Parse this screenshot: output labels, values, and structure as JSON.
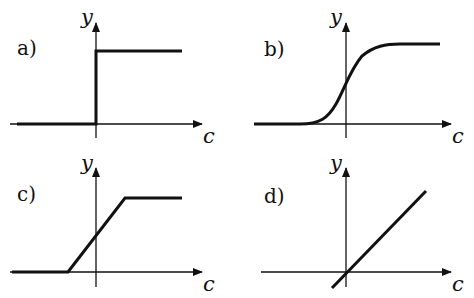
{
  "figure": {
    "panels": [
      {
        "id": "a",
        "label": "a)",
        "x_axis_label": "c",
        "y_axis_label": "y",
        "curve": "step function"
      },
      {
        "id": "b",
        "label": "b)",
        "x_axis_label": "c",
        "y_axis_label": "y",
        "curve": "sigmoid"
      },
      {
        "id": "c",
        "label": "c)",
        "x_axis_label": "c",
        "y_axis_label": "y",
        "curve": "saturating linear ramp"
      },
      {
        "id": "d",
        "label": "d)",
        "x_axis_label": "c",
        "y_axis_label": "y",
        "curve": "linear"
      }
    ],
    "colors": {
      "ink": "#111111",
      "background": "#ffffff"
    }
  }
}
